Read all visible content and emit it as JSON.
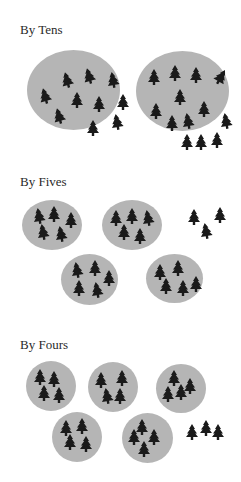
{
  "colors": {
    "background": "#ffffff",
    "group_fill": "#b5b5b5",
    "tree_fill": "#1a1a1a",
    "heading_text": "#2a2a2a"
  },
  "icons": {
    "tree": "tree-icon"
  },
  "total_trees": 23,
  "sections": [
    {
      "id": "tens",
      "heading": "By Tens",
      "group_size": 10,
      "group_count": 2,
      "remainder": 3,
      "heading_pos": {
        "x": 20,
        "y": 23
      },
      "groups": [
        {
          "x": 27,
          "y": 50,
          "w": 93,
          "h": 80,
          "trees": [
            [
              34,
              22,
              -15
            ],
            [
              56,
              18,
              -15
            ],
            [
              80,
              22,
              -10
            ],
            [
              12,
              38,
              -15
            ],
            [
              44,
              42,
              0
            ],
            [
              66,
              46,
              0
            ],
            [
              90,
              44,
              0
            ],
            [
              26,
              58,
              -15
            ],
            [
              60,
              70,
              0
            ],
            [
              84,
              64,
              -10
            ]
          ]
        },
        {
          "x": 136,
          "y": 51,
          "w": 93,
          "h": 80,
          "trees": [
            [
              12,
              18,
              0
            ],
            [
              33,
              14,
              0
            ],
            [
              54,
              16,
              0
            ],
            [
              79,
              18,
              30
            ],
            [
              38,
              38,
              0
            ],
            [
              14,
              52,
              0
            ],
            [
              62,
              50,
              0
            ],
            [
              30,
              64,
              0
            ],
            [
              46,
              62,
              -10
            ],
            [
              84,
              62,
              -10
            ]
          ]
        }
      ],
      "leftover": {
        "x": 181,
        "y": 134,
        "trees": [
          [
            0,
            0,
            0
          ],
          [
            14,
            0,
            0
          ],
          [
            30,
            -2,
            0
          ]
        ]
      }
    },
    {
      "id": "fives",
      "heading": "By Fives",
      "group_size": 5,
      "group_count": 4,
      "remainder": 3,
      "heading_pos": {
        "x": 20,
        "y": 175
      },
      "groups": [
        {
          "x": 22,
          "y": 200,
          "w": 60,
          "h": 50,
          "trees": [
            [
              11,
              8,
              -10
            ],
            [
              26,
              6,
              0
            ],
            [
              43,
              12,
              0
            ],
            [
              15,
              24,
              -10
            ],
            [
              33,
              26,
              -10
            ]
          ]
        },
        {
          "x": 102,
          "y": 200,
          "w": 60,
          "h": 50,
          "trees": [
            [
              8,
              10,
              0
            ],
            [
              24,
              8,
              0
            ],
            [
              40,
              10,
              -10
            ],
            [
              16,
              24,
              0
            ],
            [
              32,
              28,
              0
            ]
          ]
        },
        {
          "x": 61,
          "y": 254,
          "w": 57,
          "h": 51,
          "trees": [
            [
              10,
              8,
              -10
            ],
            [
              28,
              6,
              0
            ],
            [
              42,
              16,
              0
            ],
            [
              12,
              26,
              0
            ],
            [
              30,
              28,
              -10
            ]
          ]
        },
        {
          "x": 146,
          "y": 254,
          "w": 57,
          "h": 49,
          "trees": [
            [
              8,
              10,
              0
            ],
            [
              26,
              6,
              0
            ],
            [
              14,
              24,
              0
            ],
            [
              31,
              26,
              0
            ],
            [
              44,
              22,
              0
            ]
          ]
        }
      ],
      "leftover": {
        "x": 188,
        "y": 209,
        "trees": [
          [
            0,
            0,
            0
          ],
          [
            26,
            -2,
            0
          ],
          [
            12,
            14,
            -10
          ]
        ]
      }
    },
    {
      "id": "fours",
      "heading": "By Fours",
      "group_size": 4,
      "group_count": 5,
      "remainder": 3,
      "heading_pos": {
        "x": 20,
        "y": 338
      },
      "groups": [
        {
          "x": 26,
          "y": 361,
          "w": 50,
          "h": 50,
          "trees": [
            [
              8,
              8,
              0
            ],
            [
              22,
              10,
              0
            ],
            [
              12,
              24,
              0
            ],
            [
              27,
              26,
              0
            ]
          ]
        },
        {
          "x": 88,
          "y": 362,
          "w": 50,
          "h": 50,
          "trees": [
            [
              7,
              10,
              0
            ],
            [
              28,
              8,
              0
            ],
            [
              13,
              26,
              -10
            ],
            [
              26,
              26,
              0
            ]
          ]
        },
        {
          "x": 156,
          "y": 364,
          "w": 50,
          "h": 49,
          "trees": [
            [
              12,
              6,
              0
            ],
            [
              28,
              14,
              0
            ],
            [
              6,
              22,
              0
            ],
            [
              19,
              20,
              0
            ]
          ]
        },
        {
          "x": 52,
          "y": 412,
          "w": 50,
          "h": 50,
          "trees": [
            [
              8,
              8,
              0
            ],
            [
              24,
              6,
              0
            ],
            [
              12,
              22,
              0
            ],
            [
              28,
              24,
              0
            ]
          ]
        },
        {
          "x": 122,
          "y": 413,
          "w": 51,
          "h": 50,
          "trees": [
            [
              14,
              6,
              0
            ],
            [
              6,
              16,
              0
            ],
            [
              26,
              16,
              0
            ],
            [
              16,
              28,
              0
            ]
          ]
        }
      ],
      "leftover": {
        "x": 186,
        "y": 424,
        "trees": [
          [
            0,
            0,
            0
          ],
          [
            14,
            -4,
            0
          ],
          [
            26,
            0,
            0
          ]
        ]
      }
    }
  ]
}
